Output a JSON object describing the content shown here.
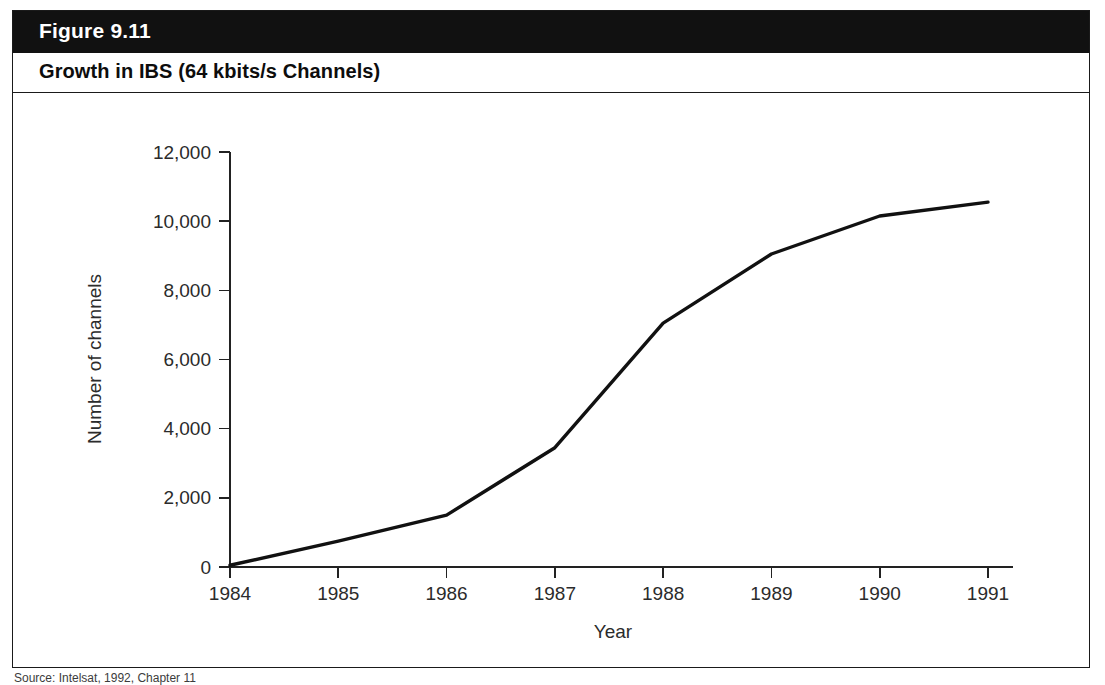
{
  "figure": {
    "label": "Figure 9.11",
    "title": "Growth in IBS (64 kbits/s Channels)",
    "source_note": "Source: Intelsat, 1992, Chapter 11"
  },
  "colors": {
    "header_bar": "#111111",
    "header_text": "#ffffff",
    "title_text": "#0d0d0d",
    "frame_border": "#1a1a1a",
    "axis": "#222222",
    "data_line": "#111111",
    "background": "#ffffff"
  },
  "chart_data": {
    "type": "line",
    "title": "Growth in IBS (64 kbits/s Channels)",
    "xlabel": "Year",
    "ylabel": "Number of channels",
    "categories": [
      "1984",
      "1985",
      "1986",
      "1987",
      "1988",
      "1989",
      "1990",
      "1991"
    ],
    "x": [
      1984,
      1985,
      1986,
      1987,
      1988,
      1989,
      1990,
      1991
    ],
    "values": [
      50,
      750,
      1500,
      3450,
      7050,
      9050,
      10150,
      10550
    ],
    "series": [
      {
        "name": "Number of channels",
        "values": [
          50,
          750,
          1500,
          3450,
          7050,
          9050,
          10150,
          10550
        ]
      }
    ],
    "xlim": [
      1984,
      1991
    ],
    "ylim": [
      0,
      12000
    ],
    "ytick_labels": [
      "0",
      "2,000",
      "4,000",
      "6,000",
      "8,000",
      "10,000",
      "12,000"
    ],
    "ytick_values": [
      0,
      2000,
      4000,
      6000,
      8000,
      10000,
      12000
    ],
    "xtick_labels": [
      "1984",
      "1985",
      "1986",
      "1987",
      "1988",
      "1989",
      "1990",
      "1991"
    ],
    "grid": false,
    "legend": false
  }
}
